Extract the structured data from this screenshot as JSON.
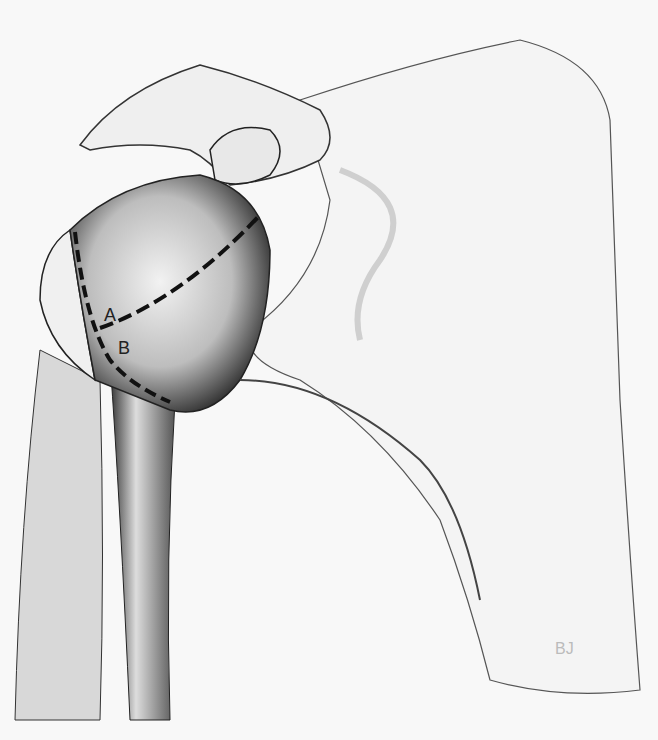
{
  "figure": {
    "labels": [
      {
        "id": "A",
        "text": "A"
      },
      {
        "id": "B",
        "text": "B"
      }
    ],
    "signature": "BJ"
  }
}
